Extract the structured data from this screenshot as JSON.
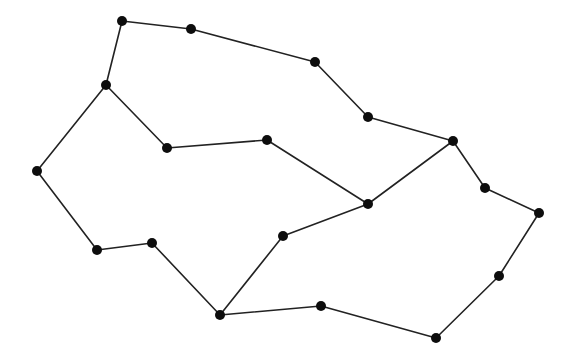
{
  "diagram": {
    "type": "undirected-graph",
    "canvas": {
      "width": 574,
      "height": 359,
      "background": "#ffffff"
    },
    "style": {
      "edge_color": "#222222",
      "edge_width": 1.6,
      "node_color": "#0d0d0d",
      "node_radius": 5
    },
    "nodes": [
      {
        "id": 0,
        "x": 122,
        "y": 21
      },
      {
        "id": 1,
        "x": 191,
        "y": 29
      },
      {
        "id": 2,
        "x": 315,
        "y": 62
      },
      {
        "id": 3,
        "x": 368,
        "y": 117
      },
      {
        "id": 4,
        "x": 453,
        "y": 141
      },
      {
        "id": 5,
        "x": 106,
        "y": 85
      },
      {
        "id": 6,
        "x": 167,
        "y": 148
      },
      {
        "id": 7,
        "x": 267,
        "y": 140
      },
      {
        "id": 8,
        "x": 368,
        "y": 204
      },
      {
        "id": 9,
        "x": 37,
        "y": 171
      },
      {
        "id": 10,
        "x": 97,
        "y": 250
      },
      {
        "id": 11,
        "x": 152,
        "y": 243
      },
      {
        "id": 12,
        "x": 220,
        "y": 315
      },
      {
        "id": 13,
        "x": 283,
        "y": 236
      },
      {
        "id": 14,
        "x": 321,
        "y": 306
      },
      {
        "id": 15,
        "x": 436,
        "y": 338
      },
      {
        "id": 16,
        "x": 485,
        "y": 188
      },
      {
        "id": 17,
        "x": 539,
        "y": 213
      },
      {
        "id": 18,
        "x": 499,
        "y": 276
      }
    ],
    "edges": [
      [
        0,
        1
      ],
      [
        1,
        2
      ],
      [
        2,
        3
      ],
      [
        3,
        4
      ],
      [
        0,
        5
      ],
      [
        5,
        6
      ],
      [
        6,
        7
      ],
      [
        7,
        8
      ],
      [
        5,
        9
      ],
      [
        9,
        10
      ],
      [
        10,
        11
      ],
      [
        11,
        12
      ],
      [
        12,
        13
      ],
      [
        13,
        8
      ],
      [
        8,
        4
      ],
      [
        12,
        14
      ],
      [
        14,
        15
      ],
      [
        4,
        16
      ],
      [
        16,
        17
      ],
      [
        17,
        18
      ],
      [
        18,
        15
      ]
    ]
  }
}
